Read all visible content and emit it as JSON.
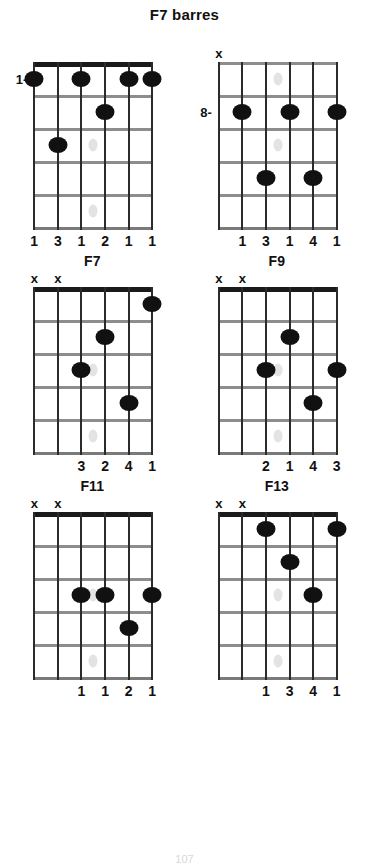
{
  "page": {
    "title": "F7 barres",
    "page_number": "107"
  },
  "layout": {
    "strings": 6,
    "frets": 5,
    "string_order_label": "low E (6) at left to high E (1) at right"
  },
  "chord_data": {
    "type": "chord-diagram-sheet",
    "instrument": "guitar",
    "diagrams": [
      {
        "title": "",
        "show_title": false,
        "position_label": "1-",
        "position_fret_row": 1,
        "show_nut": true,
        "frets": 5,
        "markers": [
          {
            "string": 6,
            "symbol": ""
          },
          {
            "string": 5,
            "symbol": ""
          },
          {
            "string": 4,
            "symbol": ""
          },
          {
            "string": 3,
            "symbol": ""
          },
          {
            "string": 2,
            "symbol": ""
          },
          {
            "string": 1,
            "symbol": ""
          }
        ],
        "dots": [
          {
            "string": 6,
            "fret": 1
          },
          {
            "string": 4,
            "fret": 1
          },
          {
            "string": 2,
            "fret": 1
          },
          {
            "string": 1,
            "fret": 1
          },
          {
            "string": 3,
            "fret": 2
          },
          {
            "string": 5,
            "fret": 3
          }
        ],
        "fingers": [
          {
            "string": 6,
            "label": "1"
          },
          {
            "string": 5,
            "label": "3"
          },
          {
            "string": 4,
            "label": "1"
          },
          {
            "string": 3,
            "label": "2"
          },
          {
            "string": 2,
            "label": "1"
          },
          {
            "string": 1,
            "label": "1"
          }
        ],
        "inlays": [
          {
            "string": 3.5,
            "fret": 3
          },
          {
            "string": 3.5,
            "fret": 5
          }
        ]
      },
      {
        "title": "",
        "show_title": false,
        "position_label": "8-",
        "position_fret_row": 2,
        "show_nut": false,
        "frets": 5,
        "markers": [
          {
            "string": 6,
            "symbol": "x"
          },
          {
            "string": 5,
            "symbol": ""
          },
          {
            "string": 4,
            "symbol": ""
          },
          {
            "string": 3,
            "symbol": ""
          },
          {
            "string": 2,
            "symbol": ""
          },
          {
            "string": 1,
            "symbol": ""
          }
        ],
        "dots": [
          {
            "string": 5,
            "fret": 2
          },
          {
            "string": 3,
            "fret": 2
          },
          {
            "string": 1,
            "fret": 2
          },
          {
            "string": 4,
            "fret": 4
          },
          {
            "string": 2,
            "fret": 4
          }
        ],
        "fingers": [
          {
            "string": 5,
            "label": "1"
          },
          {
            "string": 4,
            "label": "3"
          },
          {
            "string": 3,
            "label": "1"
          },
          {
            "string": 2,
            "label": "4"
          },
          {
            "string": 1,
            "label": "1"
          }
        ],
        "inlays": [
          {
            "string": 3.5,
            "fret": 1
          },
          {
            "string": 3.5,
            "fret": 3
          }
        ]
      },
      {
        "title": "F7",
        "show_title": true,
        "position_label": "",
        "position_fret_row": 0,
        "show_nut": true,
        "frets": 5,
        "markers": [
          {
            "string": 6,
            "symbol": "x"
          },
          {
            "string": 5,
            "symbol": "x"
          },
          {
            "string": 4,
            "symbol": ""
          },
          {
            "string": 3,
            "symbol": ""
          },
          {
            "string": 2,
            "symbol": ""
          },
          {
            "string": 1,
            "symbol": ""
          }
        ],
        "dots": [
          {
            "string": 1,
            "fret": 1
          },
          {
            "string": 3,
            "fret": 2
          },
          {
            "string": 4,
            "fret": 3
          },
          {
            "string": 2,
            "fret": 4
          }
        ],
        "fingers": [
          {
            "string": 4,
            "label": "3"
          },
          {
            "string": 3,
            "label": "2"
          },
          {
            "string": 2,
            "label": "4"
          },
          {
            "string": 1,
            "label": "1"
          }
        ],
        "inlays": [
          {
            "string": 3.5,
            "fret": 3
          },
          {
            "string": 3.5,
            "fret": 5
          }
        ]
      },
      {
        "title": "F9",
        "show_title": true,
        "position_label": "",
        "position_fret_row": 0,
        "show_nut": true,
        "frets": 5,
        "markers": [
          {
            "string": 6,
            "symbol": "x"
          },
          {
            "string": 5,
            "symbol": "x"
          },
          {
            "string": 4,
            "symbol": ""
          },
          {
            "string": 3,
            "symbol": ""
          },
          {
            "string": 2,
            "symbol": ""
          },
          {
            "string": 1,
            "symbol": ""
          }
        ],
        "dots": [
          {
            "string": 3,
            "fret": 2
          },
          {
            "string": 4,
            "fret": 3
          },
          {
            "string": 1,
            "fret": 3
          },
          {
            "string": 2,
            "fret": 4
          }
        ],
        "fingers": [
          {
            "string": 4,
            "label": "2"
          },
          {
            "string": 3,
            "label": "1"
          },
          {
            "string": 2,
            "label": "4"
          },
          {
            "string": 1,
            "label": "3"
          }
        ],
        "inlays": [
          {
            "string": 3.5,
            "fret": 3
          },
          {
            "string": 3.5,
            "fret": 5
          }
        ]
      },
      {
        "title": "F11",
        "show_title": true,
        "position_label": "",
        "position_fret_row": 0,
        "show_nut": true,
        "frets": 5,
        "markers": [
          {
            "string": 6,
            "symbol": "x"
          },
          {
            "string": 5,
            "symbol": "x"
          },
          {
            "string": 4,
            "symbol": ""
          },
          {
            "string": 3,
            "symbol": ""
          },
          {
            "string": 2,
            "symbol": ""
          },
          {
            "string": 1,
            "symbol": ""
          }
        ],
        "dots": [
          {
            "string": 4,
            "fret": 3
          },
          {
            "string": 3,
            "fret": 3
          },
          {
            "string": 1,
            "fret": 3
          },
          {
            "string": 2,
            "fret": 4
          }
        ],
        "fingers": [
          {
            "string": 4,
            "label": "1"
          },
          {
            "string": 3,
            "label": "1"
          },
          {
            "string": 2,
            "label": "2"
          },
          {
            "string": 1,
            "label": "1"
          }
        ],
        "inlays": [
          {
            "string": 3.5,
            "fret": 3
          },
          {
            "string": 3.5,
            "fret": 5
          }
        ]
      },
      {
        "title": "F13",
        "show_title": true,
        "position_label": "",
        "position_fret_row": 0,
        "show_nut": true,
        "frets": 5,
        "markers": [
          {
            "string": 6,
            "symbol": "x"
          },
          {
            "string": 5,
            "symbol": "x"
          },
          {
            "string": 4,
            "symbol": ""
          },
          {
            "string": 3,
            "symbol": ""
          },
          {
            "string": 2,
            "symbol": ""
          },
          {
            "string": 1,
            "symbol": ""
          }
        ],
        "dots": [
          {
            "string": 4,
            "fret": 1
          },
          {
            "string": 1,
            "fret": 1
          },
          {
            "string": 3,
            "fret": 2
          },
          {
            "string": 2,
            "fret": 3
          }
        ],
        "fingers": [
          {
            "string": 4,
            "label": "1"
          },
          {
            "string": 3,
            "label": "3"
          },
          {
            "string": 2,
            "label": "4"
          },
          {
            "string": 1,
            "label": "1"
          }
        ],
        "inlays": [
          {
            "string": 3.5,
            "fret": 3
          },
          {
            "string": 3.5,
            "fret": 5
          }
        ]
      }
    ]
  }
}
